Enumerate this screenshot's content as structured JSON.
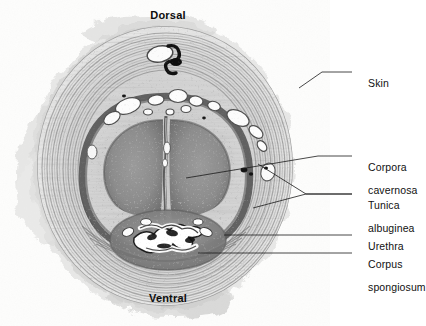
{
  "figure": {
    "type": "histology-micrograph",
    "background_color": "#ffffff",
    "specimen_tone": "grayscale"
  },
  "orientation": {
    "top_label": "Dorsal",
    "bottom_label": "Ventral"
  },
  "labels": [
    {
      "id": "skin",
      "text": "Skin",
      "lines": [
        "Skin"
      ],
      "x": 356,
      "y": 66,
      "leader_from": [
        352,
        72
      ],
      "leader_to": [
        306,
        72
      ],
      "leader_points": [
        [
          352,
          72
        ],
        [
          320,
          72
        ],
        [
          300,
          86
        ]
      ]
    },
    {
      "id": "corpora-cavernosa",
      "text": "Corpora cavernosa",
      "lines": [
        "Corpora",
        "cavernosa"
      ],
      "x": 356,
      "y": 150,
      "leader_from": [
        352,
        156
      ],
      "leader_to": [
        185,
        178
      ],
      "leader_points": [
        [
          352,
          156
        ],
        [
          316,
          156
        ],
        [
          185,
          178
        ]
      ]
    },
    {
      "id": "tunica-albuginea",
      "text": "Tunica albuginea",
      "lines": [
        "Tunica",
        "albuginea"
      ],
      "x": 356,
      "y": 188,
      "leader_from": [
        352,
        194
      ],
      "leader_to": [
        262,
        160
      ],
      "leader_points": [
        [
          352,
          194
        ],
        [
          300,
          194
        ],
        [
          262,
          160
        ]
      ],
      "second_leader_points": [
        [
          352,
          194
        ],
        [
          300,
          194
        ],
        [
          258,
          206
        ]
      ]
    },
    {
      "id": "urethra",
      "text": "Urethra",
      "lines": [
        "Urethra"
      ],
      "x": 356,
      "y": 229,
      "leader_from": [
        352,
        235
      ],
      "leader_to": [
        222,
        235
      ],
      "leader_points": [
        [
          352,
          235
        ],
        [
          222,
          235
        ]
      ]
    },
    {
      "id": "corpus-spongiosum",
      "text": "Corpus spongiosum",
      "lines": [
        "Corpus",
        "spongiosum"
      ],
      "x": 356,
      "y": 247,
      "leader_from": [
        352,
        253
      ],
      "leader_to": [
        196,
        253
      ],
      "leader_points": [
        [
          352,
          253
        ],
        [
          196,
          253
        ]
      ]
    }
  ],
  "structures": {
    "corpora_cavernosa_count": 2,
    "septum_present": true,
    "urethra_lumen_shape": "stellate",
    "dorsal_vessels_visible": true
  }
}
